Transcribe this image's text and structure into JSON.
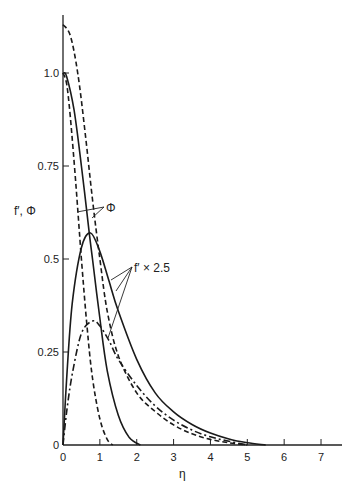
{
  "chart_data": {
    "type": "line",
    "title": "",
    "xlabel": "η",
    "ylabel": "f′, Φ",
    "xlim": [
      0,
      7.5
    ],
    "ylim": [
      0,
      1.2
    ],
    "grid": false,
    "legend": "none (inline annotations)",
    "x_ticks": [
      "0",
      "1",
      "2",
      "3",
      "4",
      "5",
      "6",
      "7"
    ],
    "y_ticks": [
      "0",
      "0.25",
      "0.5",
      "0.75",
      "1.0"
    ],
    "annotations": [
      {
        "text": "Φ",
        "points_to": [
          "inner dashed curve from 1.0",
          "solid curve from 1.0"
        ]
      },
      {
        "text": "f′ × 2.5",
        "points_to": [
          "solid hump curve",
          "outer dashed curve",
          "dash-dot hump curve"
        ]
      }
    ],
    "series": [
      {
        "name": "Φ (solid, from 1.0)",
        "style": "solid",
        "x": [
          0,
          0.1,
          0.3,
          0.5,
          0.7,
          0.8,
          1.0,
          1.2,
          1.5,
          1.8,
          2.1
        ],
        "y": [
          1.0,
          0.99,
          0.9,
          0.75,
          0.58,
          0.5,
          0.34,
          0.2,
          0.08,
          0.02,
          0.0
        ]
      },
      {
        "name": "Φ (dashed, from 1.0)",
        "style": "dashed",
        "x": [
          0,
          0.1,
          0.2,
          0.35,
          0.5,
          0.65,
          0.8,
          1.0,
          1.2,
          1.35
        ],
        "y": [
          1.0,
          0.97,
          0.88,
          0.7,
          0.5,
          0.32,
          0.18,
          0.07,
          0.015,
          0.0
        ]
      },
      {
        "name": "f′ × 2.5 (dashed, from 1.13)",
        "style": "dashed",
        "x": [
          0,
          0.2,
          0.4,
          0.6,
          0.8,
          1.0,
          1.2,
          1.5,
          2.0,
          2.5,
          3.0,
          3.5,
          4.0,
          4.5,
          5.0
        ],
        "y": [
          1.13,
          1.1,
          1.0,
          0.84,
          0.66,
          0.5,
          0.36,
          0.24,
          0.14,
          0.09,
          0.054,
          0.03,
          0.015,
          0.006,
          0.0
        ]
      },
      {
        "name": "f′ × 2.5 (solid hump)",
        "style": "solid",
        "x": [
          0,
          0.1,
          0.25,
          0.5,
          0.75,
          1.0,
          1.25,
          1.5,
          2.0,
          2.5,
          3.0,
          3.5,
          4.0,
          4.5,
          5.0,
          5.5
        ],
        "y": [
          0,
          0.18,
          0.38,
          0.53,
          0.57,
          0.52,
          0.44,
          0.36,
          0.23,
          0.14,
          0.089,
          0.055,
          0.032,
          0.016,
          0.006,
          0.0
        ]
      },
      {
        "name": "f′ × 2.5 (dash-dot hump)",
        "style": "dash-dot",
        "x": [
          0,
          0.1,
          0.25,
          0.5,
          0.8,
          1.0,
          1.25,
          1.5,
          2.0,
          2.5,
          3.0,
          3.5,
          4.0,
          4.5,
          5.0
        ],
        "y": [
          0,
          0.09,
          0.19,
          0.3,
          0.333,
          0.32,
          0.28,
          0.23,
          0.16,
          0.105,
          0.067,
          0.04,
          0.022,
          0.01,
          0.0
        ]
      }
    ]
  },
  "axes": {
    "x_label": "η",
    "y_label": "f′, Φ",
    "x_ticks": [
      "0",
      "1",
      "2",
      "3",
      "4",
      "5",
      "6",
      "7"
    ],
    "y_ticks": [
      "0",
      "0.25",
      "0.5",
      "0.75",
      "1.0"
    ]
  },
  "annotations": {
    "phi": "Φ",
    "fprime": "f′ × 2.5"
  }
}
